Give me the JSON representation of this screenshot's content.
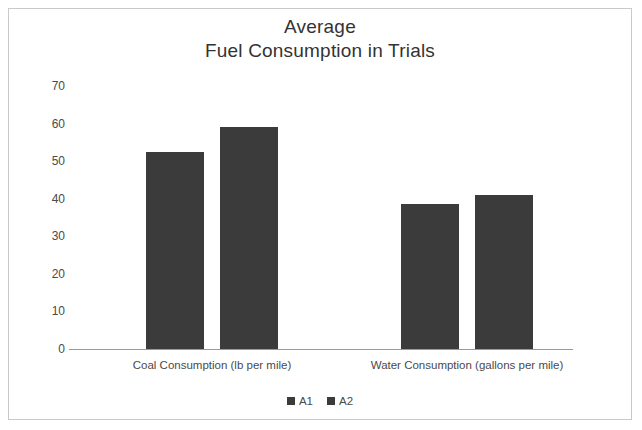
{
  "chart_data": {
    "type": "bar",
    "title": "Average Fuel Consumption in Trials",
    "title_lines": [
      "Average",
      "Fuel Consumption in Trials"
    ],
    "categories": [
      "Coal Consumption (lb per mile)",
      "Water Consumption (gallons per mile)"
    ],
    "series": [
      {
        "name": "A1",
        "values": [
          52.5,
          38.5
        ],
        "color": "#3b3b3b"
      },
      {
        "name": "A2",
        "values": [
          59.0,
          41.0
        ],
        "color": "#3b3b3b"
      }
    ],
    "xlabel": "",
    "ylabel": "",
    "ylim": [
      0,
      70
    ],
    "yticks": [
      0,
      10,
      20,
      30,
      40,
      50,
      60,
      70
    ],
    "ytick_labels": [
      "0",
      "10",
      "20",
      "30",
      "40",
      "50",
      "60",
      "70"
    ],
    "grid": false,
    "legend_position": "bottom",
    "legend_entries": [
      "A1",
      "A2"
    ],
    "frame_color": "#c9c9c9",
    "axis_color": "#9a9a9a",
    "background": "#ffffff"
  }
}
